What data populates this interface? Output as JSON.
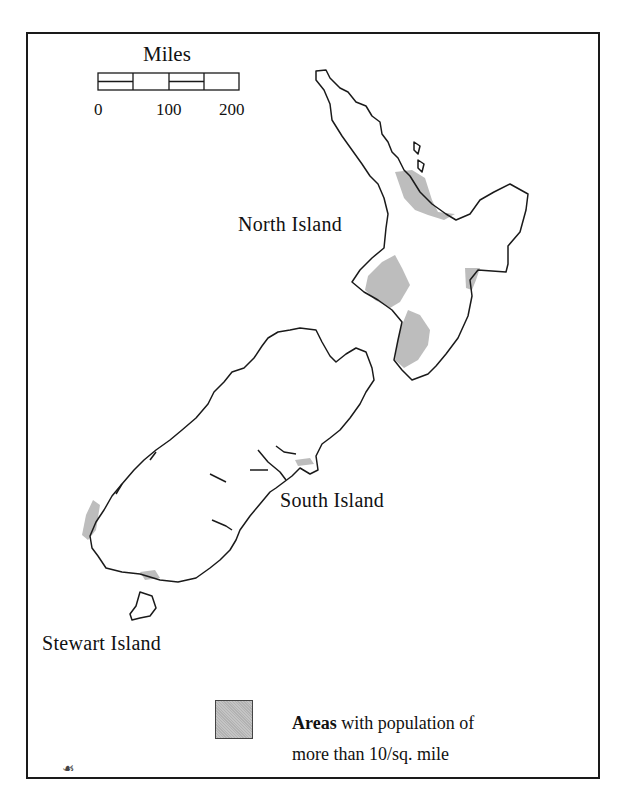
{
  "map": {
    "subject": "New Zealand population density",
    "colors": {
      "coastline": "#1a1a1a",
      "populated_fill": "#bdbdbd",
      "frame": "#1a1a1a",
      "background": "#ffffff"
    }
  },
  "scale_bar": {
    "title": "Miles",
    "ticks": [
      "0",
      "100",
      "200"
    ]
  },
  "labels": {
    "north_island": "North Island",
    "south_island": "South Island",
    "stewart_island": "Stewart Island"
  },
  "legend": {
    "items": [
      {
        "swatch_color": "#bdbdbd",
        "line1_bold": "Areas",
        "line1_rest": " with population of",
        "line2": "more than 10/sq. mile"
      }
    ]
  },
  "corner_mark": "☙"
}
